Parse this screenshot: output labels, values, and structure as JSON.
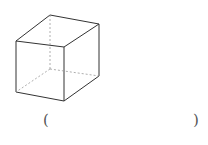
{
  "figure": {
    "type": "cube",
    "stroke_color": "#333333",
    "hidden_stroke_color": "#999999",
    "vertices": {
      "front_top_left": [
        16,
        41
      ],
      "front_top_right": [
        64,
        47
      ],
      "front_bottom_left": [
        16,
        92
      ],
      "front_bottom_right": [
        64,
        101
      ],
      "back_top_left": [
        50,
        15
      ],
      "back_top_right": [
        99,
        24
      ],
      "back_bottom_right": [
        99,
        76
      ],
      "back_bottom_left": [
        50,
        69
      ]
    }
  },
  "answer_blank": {
    "left_paren": "(",
    "right_paren": ")",
    "value": ""
  }
}
